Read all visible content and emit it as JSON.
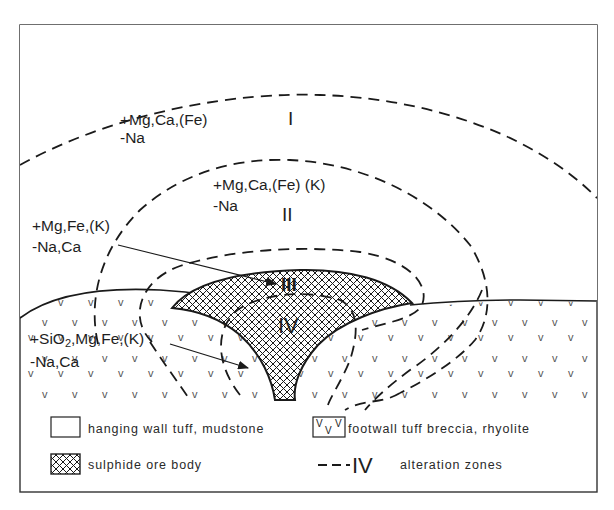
{
  "figure": {
    "type": "geological cross-section"
  },
  "zones": [
    {
      "numeral": "I",
      "gains": "+Mg,Ca,(Fe)",
      "losses": "-Na"
    },
    {
      "numeral": "II",
      "gains": "+Mg,Ca,(Fe) (K)",
      "losses": "-Na"
    },
    {
      "numeral": "III",
      "gains": "+Mg,Fe,(K)",
      "losses": "-Na,Ca"
    },
    {
      "numeral": "IV",
      "gains_prefix": "+SiO",
      "gains_sub": "2",
      "gains_suffix": ",Mg,Fe,(K)",
      "losses": "-Na,Ca"
    }
  ],
  "legend": {
    "hanging_wall": "hanging wall tuff, mudstone",
    "footwall": "footwall tuff breccia, rhyolite",
    "footwall_symbol_1": "V",
    "footwall_symbol_2": "V",
    "footwall_symbol_3": "V",
    "ore_body": "sulphide ore body",
    "alteration_symbol": "IV",
    "alteration": "alteration zones"
  },
  "colors": {
    "line": "#1a1a1a",
    "background": "#ffffff",
    "footwall_mark": "#555555"
  }
}
